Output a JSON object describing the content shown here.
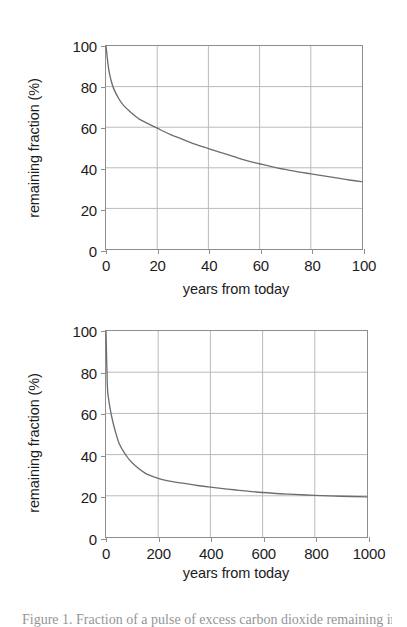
{
  "figure": {
    "caption": "Figure 1.  Fraction of a pulse of excess carbon dioxide remaining in the atmosphere."
  },
  "chart_data": [
    {
      "type": "line",
      "title": "",
      "xlabel": "years from today",
      "ylabel": "remaining fraction (%)",
      "xlim": [
        0,
        100
      ],
      "ylim": [
        0,
        100
      ],
      "xticks": [
        0,
        20,
        40,
        60,
        80,
        100
      ],
      "yticks": [
        0,
        20,
        40,
        60,
        80,
        100
      ],
      "xtick_labels": [
        "0",
        "20",
        "40",
        "60",
        "80",
        "100"
      ],
      "ytick_labels": [
        "0",
        "20",
        "40",
        "60",
        "80",
        "100"
      ],
      "grid": true,
      "legend": "none",
      "series": [
        {
          "name": "remaining fraction",
          "x": [
            0,
            1,
            2,
            3,
            5,
            7,
            10,
            13,
            16,
            20,
            25,
            30,
            35,
            40,
            45,
            50,
            55,
            60,
            65,
            70,
            75,
            80,
            85,
            90,
            95,
            100
          ],
          "values": [
            100,
            89,
            83,
            79,
            74,
            70.5,
            67,
            64,
            62,
            59.5,
            56.5,
            54,
            51.5,
            49.5,
            47.5,
            45.5,
            43.5,
            42,
            40.5,
            39.2,
            38,
            37,
            36,
            35,
            34,
            33.2
          ]
        }
      ]
    },
    {
      "type": "line",
      "title": "",
      "xlabel": "years from today",
      "ylabel": "remaining fraction (%)",
      "xlim": [
        0,
        1000
      ],
      "ylim": [
        0,
        100
      ],
      "xticks": [
        0,
        200,
        400,
        600,
        800,
        1000
      ],
      "yticks": [
        0,
        20,
        40,
        60,
        80,
        100
      ],
      "xtick_labels": [
        "0",
        "200",
        "400",
        "600",
        "800",
        "1000"
      ],
      "ytick_labels": [
        "0",
        "20",
        "40",
        "60",
        "80",
        "100"
      ],
      "grid": true,
      "legend": "none",
      "series": [
        {
          "name": "remaining fraction",
          "x": [
            0,
            5,
            10,
            20,
            30,
            50,
            75,
            100,
            150,
            200,
            250,
            300,
            350,
            400,
            500,
            600,
            700,
            800,
            900,
            1000
          ],
          "values": [
            100,
            74,
            67,
            59.5,
            54,
            45.5,
            40,
            36,
            31,
            28.5,
            27,
            26,
            25,
            24.2,
            22.8,
            21.6,
            20.8,
            20.2,
            19.8,
            19.5
          ]
        }
      ]
    }
  ]
}
